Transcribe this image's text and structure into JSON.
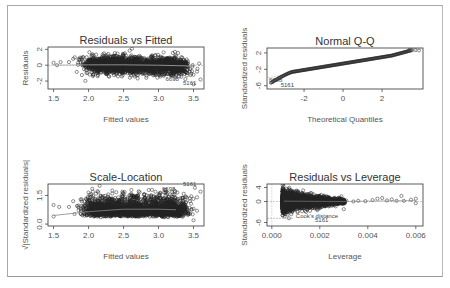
{
  "chart_data": [
    {
      "id": "p1",
      "type": "scatter",
      "title": "Residuals vs Fitted",
      "xlabel": "Fitted values",
      "ylabel": "Residuals",
      "xlim": [
        1.42,
        3.65
      ],
      "ylim": [
        -3.0,
        2.3
      ],
      "xticks": [
        1.5,
        2.0,
        2.5,
        3.0,
        3.5
      ],
      "xtick_labels": [
        "1.5",
        "2.0",
        "2.5",
        "3.0",
        "3.5"
      ],
      "yticks": [
        -2,
        0,
        2
      ],
      "ytick_labels": [
        "-2",
        "0",
        "2"
      ],
      "box": [
        48,
        47,
        204,
        89
      ],
      "annotations": [
        {
          "text": "6698",
          "x": 3.1,
          "y": -2.0
        },
        {
          "text": "5161",
          "x": 3.35,
          "y": -2.5
        }
      ],
      "cloud": {
        "xmin": 1.95,
        "xmax": 3.4,
        "ycenter": 0,
        "spread": 0.9
      },
      "smooth": [
        [
          1.5,
          0.0
        ],
        [
          2.0,
          0.05
        ],
        [
          2.5,
          0.05
        ],
        [
          3.0,
          0.0
        ],
        [
          3.5,
          -0.1
        ]
      ]
    },
    {
      "id": "p2",
      "type": "line",
      "title": "Normal Q-Q",
      "xlabel": "Theoretical Quantiles",
      "ylabel": "Standardized residuals",
      "xlim": [
        -3.9,
        4.1
      ],
      "ylim": [
        -6.8,
        3.2
      ],
      "xticks": [
        -2,
        0,
        2
      ],
      "xtick_labels": [
        "-2",
        "0",
        "2"
      ],
      "yticks": [
        -6,
        -2,
        2
      ],
      "ytick_labels": [
        "-6",
        "-2",
        "2"
      ],
      "box": [
        267,
        48,
        423,
        89
      ],
      "annotations": [
        {
          "text": "6698",
          "x": -3.8,
          "y": -5.2
        },
        {
          "text": "5161",
          "x": -3.2,
          "y": -6.3
        },
        {
          "text": "900",
          "x": 3.3,
          "y": 2.2
        }
      ]
    },
    {
      "id": "p3",
      "type": "scatter",
      "title": "Scale-Location",
      "xlabel": "Fitted values",
      "ylabel": "√|Standardized residuals|",
      "xlim": [
        1.42,
        3.65
      ],
      "ylim": [
        -0.1,
        2.1
      ],
      "xticks": [
        1.5,
        2.0,
        2.5,
        3.0,
        3.5
      ],
      "xtick_labels": [
        "1.5",
        "2.0",
        "2.5",
        "3.0",
        "3.5"
      ],
      "yticks": [
        0.0,
        1.5
      ],
      "ytick_labels": [
        "0.0",
        "1.5"
      ],
      "box": [
        48,
        184,
        204,
        226
      ],
      "annotations": [
        {
          "text": "6698",
          "x": 3.05,
          "y": 1.75
        },
        {
          "text": "5161",
          "x": 3.35,
          "y": 2.0
        }
      ],
      "smooth": [
        [
          1.5,
          0.45
        ],
        [
          2.0,
          0.65
        ],
        [
          2.5,
          0.78
        ],
        [
          3.0,
          0.78
        ],
        [
          3.25,
          0.75
        ]
      ]
    },
    {
      "id": "p4",
      "type": "scatter",
      "title": "Residuals vs Leverage",
      "xlabel": "Leverage",
      "ylabel": "Standardized residuals",
      "xlim": [
        -0.0002,
        0.0063
      ],
      "ylim": [
        -7.0,
        5.0
      ],
      "xticks": [
        0.0,
        0.002,
        0.004,
        0.006
      ],
      "xtick_labels": [
        "0.000",
        "0.002",
        "0.004",
        "0.006"
      ],
      "yticks": [
        -6,
        0,
        4
      ],
      "ytick_labels": [
        "-6",
        "0",
        "4"
      ],
      "box": [
        267,
        184,
        423,
        226
      ],
      "annotations": [
        {
          "text": "Cook's distance",
          "x": 0.001,
          "y": -4.8
        },
        {
          "text": "5161",
          "x": 0.0018,
          "y": -5.8
        }
      ]
    }
  ]
}
